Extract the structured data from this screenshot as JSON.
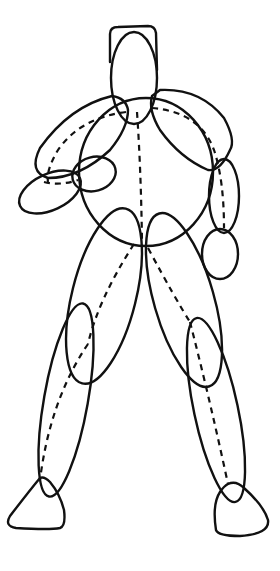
{
  "figure": {
    "stroke_color": "#111111",
    "background_color": "#ffffff",
    "parts": [
      "head",
      "torso",
      "left-upper-arm",
      "left-forearm",
      "left-hand",
      "right-upper-arm",
      "right-forearm",
      "right-hand",
      "left-thigh",
      "left-shin",
      "left-foot",
      "right-thigh",
      "right-shin",
      "right-foot"
    ]
  }
}
